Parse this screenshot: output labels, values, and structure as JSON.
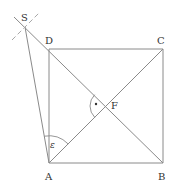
{
  "diagram": {
    "points": {
      "A": {
        "label": "A",
        "x": 49,
        "y": 163
      },
      "B": {
        "label": "B",
        "x": 163,
        "y": 163
      },
      "C": {
        "label": "C",
        "x": 163,
        "y": 49
      },
      "D": {
        "label": "D",
        "x": 49,
        "y": 49
      },
      "F": {
        "label": "F",
        "x": 106,
        "y": 106
      },
      "S": {
        "label": "S",
        "x": 25,
        "y": 27
      }
    },
    "angle_label": "ε",
    "right_angle_mark": "·",
    "colors": {
      "line": "#8a8a8a",
      "dashed": "#a8a8a8",
      "text": "#333333",
      "background": "#ffffff"
    }
  }
}
